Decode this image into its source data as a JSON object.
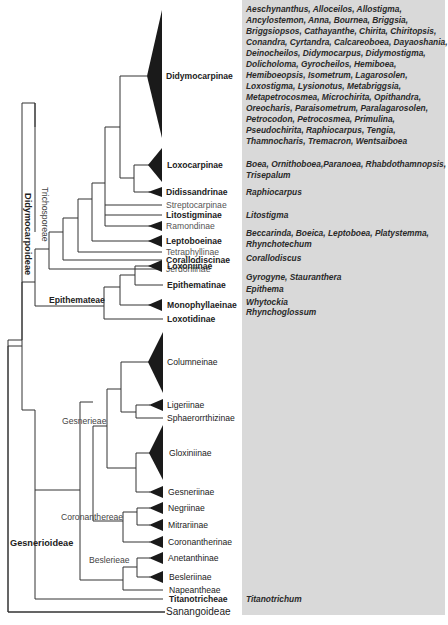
{
  "figure": {
    "type": "phylogenetic-tree",
    "panel_color": "#d9d9d9",
    "subfamilies": [
      {
        "id": "didymocarpoideae",
        "label": "Didymocarpoideae"
      },
      {
        "id": "gesnerioideae",
        "label": "Gesnerioideae"
      },
      {
        "id": "sanangoideae",
        "label": "Sanangoideae"
      }
    ],
    "tribes": {
      "trichosporeae": "Trichosporeae",
      "epithemateae": "Epithemateae",
      "gesnerieae": "Gesnerieae",
      "coronanthereae": "Coronanthereae",
      "beslerieae": "Beslerieae"
    },
    "taxa": [
      {
        "label": "Didymocarpinae",
        "genera": "Aeschynanthus, Alloceilos, Allostigma, Ancylostemon, Anna, Bournea, Briggsia, Briggsiopsos, Cathayanthe, Chirita, Chiritopsis, Conandra, Cyrtandra, Calcareoboea, Dayaoshania, Deinocheilos, Didymocarpus, Didymostigma, Dolicholoma, Gyrocheilos, Hemiboea, Hemiboeopsis, Isometrum, Lagarosolen, Loxostigma, Lysionotus, Metabriggsia, Metapetrocosmea, Microchirita, Opithandra, Oreocharis, Paraisometrum, Paralagarosolen, Petrocodon, Petrocosmea, Primulina, Pseudochirita, Raphiocarpus, Tengia, Thamnocharis, Tremacron, Wentsaiboea"
      },
      {
        "label": "Loxocarpinae",
        "genera": "Boea, Ornithoboea,Paranoea, Rhabdothamnopsis, Trisepalum"
      },
      {
        "label": "Didissandrinae",
        "genera": "Raphiocarpus"
      },
      {
        "label": "Streptocarpinae",
        "genera": ""
      },
      {
        "label": "Litostigminae",
        "genera": "Litostigma"
      },
      {
        "label": "Ramondinae",
        "genera": ""
      },
      {
        "label": "Leptoboeinae",
        "genera": "Beccarinda, Boeica, Leptoboea, Platystemma, Rhynchotechum"
      },
      {
        "label": "Tetraphyllinae",
        "genera": ""
      },
      {
        "label": "Corallodiscinae",
        "genera": "Corallodiscus"
      },
      {
        "label": "Jerdoniinae",
        "genera": ""
      },
      {
        "label": "Loxoniinae",
        "genera": "Gyrogyne, Stauranthera"
      },
      {
        "label": "Epithematinae",
        "genera": "Epithema"
      },
      {
        "label": "Monophyllaeinae",
        "genera": "Whytockia"
      },
      {
        "label": "Loxotidinae",
        "genera": "Rhynchoglossum"
      },
      {
        "label": "Columneinae",
        "genera": ""
      },
      {
        "label": "Ligeriinae",
        "genera": ""
      },
      {
        "label": "Sphaerorrthizinae",
        "genera": ""
      },
      {
        "label": "Gloxiniinae",
        "genera": ""
      },
      {
        "label": "Gesneriinae",
        "genera": ""
      },
      {
        "label": "Negriinae",
        "genera": ""
      },
      {
        "label": "Mitrariinae",
        "genera": ""
      },
      {
        "label": "Coronantherinae",
        "genera": ""
      },
      {
        "label": "Anetanthinae",
        "genera": ""
      },
      {
        "label": "Besleriinae",
        "genera": ""
      },
      {
        "label": "Napeantheae",
        "genera": ""
      },
      {
        "label": "Titanotricheae",
        "genera": "Titanotrichum"
      },
      {
        "label": "Sanangoideae",
        "genera": ""
      }
    ],
    "genera_lines": {
      "didymocarpinae": [
        "Aeschynanthus, Alloceilos, Allostigma,",
        "Ancylostemon, Anna, Bournea, Briggsia,",
        "Briggsiopsos, Cathayanthe, Chirita, Chiritopsis,",
        "Conandra, Cyrtandra, Calcareoboea, Dayaoshania,",
        "Deinocheilos, Didymocarpus, Didymostigma,",
        "Dolicholoma, Gyrocheilos, Hemiboea,",
        "Hemiboeopsis, Isometrum, Lagarosolen,",
        "Loxostigma, Lysionotus, Metabriggsia,",
        "Metapetrocosmea, Microchirita, Opithandra,",
        "Oreocharis, Paraisometrum, Paralagarosolen,",
        "Petrocodon, Petrocosmea, Primulina,",
        "Pseudochirita, Raphiocarpus, Tengia,",
        "Thamnocharis, Tremacron, Wentsaiboea"
      ],
      "loxocarpinae": [
        "Boea, Ornithoboea,Paranoea, Rhabdothamnopsis,",
        "Trisepalum"
      ],
      "didissandrinae": [
        "Raphiocarpus"
      ],
      "litostigminae": [
        "Litostigma"
      ],
      "leptoboeinae": [
        "Beccarinda, Boeica, Leptoboea, Platystemma,",
        "Rhynchotechum"
      ],
      "corallodiscinae": [
        "Corallodiscus"
      ],
      "loxoniinae": [
        "Gyrogyne, Stauranthera"
      ],
      "epithematinae": [
        "Epithema"
      ],
      "monophyllaeinae": [
        "Whytockia"
      ],
      "loxotidinae": [
        "Rhynchoglossum"
      ],
      "titanotricheae": [
        "Titanotrichum"
      ]
    }
  }
}
